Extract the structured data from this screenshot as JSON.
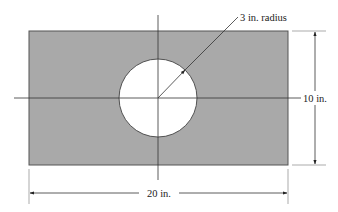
{
  "diagram": {
    "plate": {
      "width_label": "20 in.",
      "height_label": "10 in.",
      "fill": "#a9a9a9",
      "stroke": "#444444"
    },
    "hole": {
      "radius_label": "3 in. radius",
      "fill": "#ffffff"
    },
    "labels": {
      "radius": "3 in. radius",
      "height": "10 in.",
      "width": "20 in."
    },
    "geometry": {
      "rect": {
        "x": 29,
        "y": 31,
        "w": 259,
        "h": 134
      },
      "circle": {
        "cx": 158,
        "cy": 98,
        "r": 39
      },
      "v_centerline": {
        "x": 158,
        "y1": 15,
        "y2": 180
      },
      "h_centerline": {
        "y": 98,
        "x1": 14,
        "x2": 301
      },
      "radius_arrow": {
        "x1": 158,
        "y1": 98,
        "x2": 185,
        "y2": 70
      },
      "leader": {
        "x1": 185,
        "y1": 70,
        "x2": 238,
        "y2": 17
      },
      "height_dim": {
        "x": 315,
        "y1": 31,
        "y2": 165,
        "ext_x1": 292,
        "ext_x2": 326
      },
      "width_dim": {
        "y": 193,
        "x1": 29,
        "x2": 288,
        "ext_y1": 169,
        "ext_y2": 204
      }
    }
  }
}
